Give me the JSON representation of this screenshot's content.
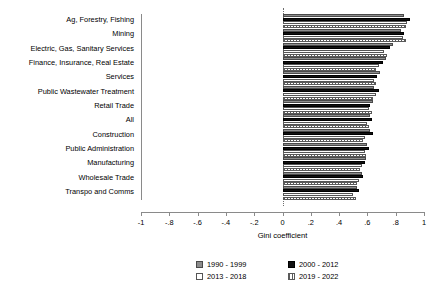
{
  "chart_data": {
    "type": "bar",
    "orientation": "horizontal",
    "title": "",
    "xlabel": "Gini coefficient",
    "ylabel": "",
    "xlim": [
      -1,
      1
    ],
    "xticks": [
      -1,
      -0.8,
      -0.6,
      -0.4,
      -0.2,
      0,
      0.2,
      0.4,
      0.6,
      0.8,
      1
    ],
    "xtick_labels": [
      "-1",
      "-.8",
      "-.6",
      "-.4",
      "-.2",
      "0",
      ".2",
      ".4",
      ".6",
      ".8",
      "1"
    ],
    "grid": false,
    "legend_position": "bottom",
    "zero_reference_line": true,
    "categories": [
      "Ag, Forestry, Fishing",
      "Mining",
      "Electric, Gas, Sanitary Services",
      "Finance, Insurance, Real Estate",
      "Services",
      "Public Wastewater Treatment",
      "Retail Trade",
      "All",
      "Construction",
      "Public Administration",
      "Manufacturing",
      "Wholesale Trade",
      "Transpo and Comms"
    ],
    "series": [
      {
        "name": "1990 - 1999",
        "color": "#8c8c8c",
        "values": [
          0.86,
          0.84,
          0.78,
          0.73,
          0.69,
          0.65,
          0.64,
          0.62,
          0.62,
          0.6,
          0.59,
          0.56,
          0.53
        ]
      },
      {
        "name": "2000 - 2012",
        "color": "#111111",
        "values": [
          0.9,
          0.86,
          0.76,
          0.71,
          0.67,
          0.68,
          0.62,
          0.63,
          0.64,
          0.61,
          0.58,
          0.57,
          0.54
        ]
      },
      {
        "name": "2013 - 2018",
        "color": "#ffffff",
        "values": [
          0.88,
          0.85,
          0.72,
          0.68,
          0.65,
          0.66,
          0.61,
          0.6,
          0.58,
          0.58,
          0.56,
          0.54,
          0.5
        ]
      },
      {
        "name": "2019 - 2022",
        "color": "#f2f2f2",
        "values": [
          0.87,
          0.87,
          0.74,
          0.66,
          0.66,
          0.64,
          0.63,
          0.61,
          0.57,
          0.59,
          0.55,
          0.53,
          0.52
        ]
      }
    ]
  },
  "legend": {
    "items": [
      {
        "label": "1990 - 1999"
      },
      {
        "label": "2000 - 2012"
      },
      {
        "label": "2013 - 2018"
      },
      {
        "label": "2019 - 2022"
      }
    ]
  }
}
